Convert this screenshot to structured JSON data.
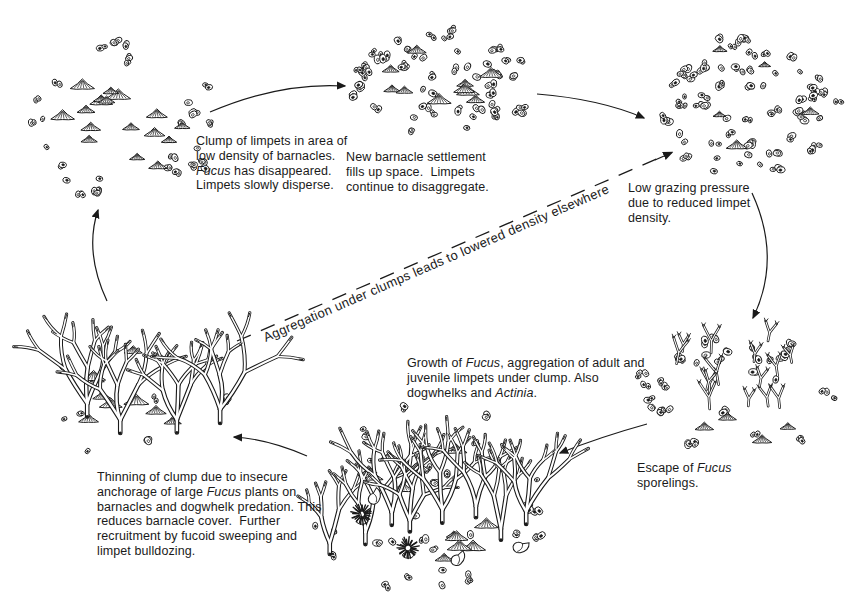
{
  "figure": {
    "kind": "ecological cycle diagram (hand-drawn)",
    "dashed_label": "Aggregation under clumps leads to lowered density elsewhere",
    "nodes": [
      {
        "id": "limpet-clump",
        "caption": [
          {
            "t": "Clump of limpets in area of low density of barnacles. "
          },
          {
            "t": "Fucus",
            "i": true
          },
          {
            "t": " has disappeared. Limpets slowly disperse."
          }
        ],
        "illustration": {
          "type": "limpets-dispersing-among-sparse-barnacles",
          "limpets": 17,
          "barnacles": 50
        }
      },
      {
        "id": "barnacle-settlement",
        "caption": [
          {
            "t": "New barnacle settlement fills up space.  Limpets continue to disaggregate."
          }
        ],
        "illustration": {
          "type": "dense-barnacles-with-limpets",
          "limpets": 10,
          "barnacles": 95
        }
      },
      {
        "id": "low-grazing",
        "caption": [
          {
            "t": "Low grazing pressure due to reduced limpet density."
          }
        ],
        "illustration": {
          "type": "very-dense-barnacles-few-limpets",
          "limpets": 5,
          "barnacles": 130
        }
      },
      {
        "id": "fucus-escape",
        "caption": [
          {
            "t": "Escape of "
          },
          {
            "t": "Fucus",
            "i": true
          },
          {
            "t": " sporelings."
          }
        ],
        "illustration": {
          "type": "fucus-sporelings-on-barnacles",
          "sporelings": 15,
          "barnacles": 60,
          "limpets": 4
        }
      },
      {
        "id": "fucus-growth",
        "caption": [
          {
            "t": "Growth of "
          },
          {
            "t": "Fucus",
            "i": true
          },
          {
            "t": ", aggregation of adult and juvenile limpets under clump. Also dogwhelks and "
          },
          {
            "t": "Actinia",
            "i": true
          },
          {
            "t": "."
          }
        ],
        "illustration": {
          "type": "mature-fucus-clump",
          "fucus_plants": 8,
          "limpets": 13,
          "barnacles": 55,
          "dogwhelks": 3,
          "anemones": 2
        }
      },
      {
        "id": "clump-thinning",
        "caption": [
          {
            "t": "Thinning of clump due to insecure anchorage of large "
          },
          {
            "t": "Fucus",
            "i": true
          },
          {
            "t": " plants on barnacles and dogwhelk predation. This reduces barnacle cover.  Further recruitment by fucoid sweeping and limpet bulldozing."
          }
        ],
        "illustration": {
          "type": "thinning-fucus-clump",
          "fucus_plants": 4,
          "limpets": 9,
          "barnacles": 14
        }
      }
    ],
    "arrows": [
      {
        "from": "limpet-clump",
        "to": "barnacle-settlement",
        "style": "solid"
      },
      {
        "from": "barnacle-settlement",
        "to": "low-grazing",
        "style": "solid"
      },
      {
        "from": "low-grazing",
        "to": "fucus-escape",
        "style": "solid"
      },
      {
        "from": "fucus-escape",
        "to": "fucus-growth",
        "style": "solid"
      },
      {
        "from": "fucus-growth",
        "to": "clump-thinning",
        "style": "solid"
      },
      {
        "from": "clump-thinning",
        "to": "limpet-clump",
        "style": "solid"
      },
      {
        "from": "fucus-growth",
        "to": "low-grazing",
        "style": "dashed",
        "label": "Aggregation under clumps leads to lowered density elsewhere"
      }
    ],
    "ink_color": "#1a1a1a",
    "background_color": "#ffffff"
  }
}
